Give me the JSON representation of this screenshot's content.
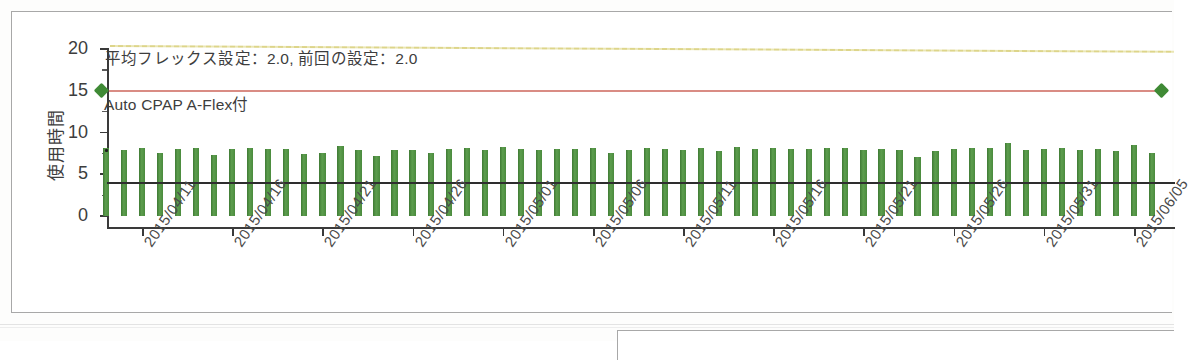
{
  "panel": {
    "name": "usage-chart-panel"
  },
  "chart_data": {
    "type": "bar",
    "title": "",
    "xlabel": "",
    "ylabel": "使用時間",
    "ylim": [
      0,
      21.5
    ],
    "yticks": [
      0,
      5,
      10,
      15,
      20
    ],
    "grid": false,
    "legend": "none",
    "x_start_date": "2015/04/09",
    "x_tick_labels": [
      "2015/04/11",
      "2015/04/16",
      "2015/04/21",
      "2015/04/26",
      "2015/05/01",
      "2015/05/06",
      "2015/05/11",
      "2015/05/16",
      "2015/05/21",
      "2015/05/26",
      "2015/05/31",
      "2015/06/05"
    ],
    "x_tick_indices": [
      2,
      7,
      12,
      17,
      22,
      27,
      32,
      37,
      42,
      47,
      52,
      57
    ],
    "series": [
      {
        "name": "使用時間",
        "type": "bar",
        "color": "#4c8c3f",
        "values": [
          8.1,
          7.9,
          8.1,
          7.6,
          8.0,
          8.1,
          7.3,
          8.0,
          8.1,
          8.0,
          8.0,
          7.4,
          7.5,
          8.4,
          7.9,
          7.2,
          7.9,
          7.9,
          7.6,
          8.0,
          8.1,
          7.9,
          8.3,
          8.0,
          7.9,
          8.0,
          8.0,
          8.1,
          7.5,
          7.9,
          8.2,
          8.0,
          7.9,
          8.1,
          7.8,
          8.3,
          8.0,
          8.2,
          8.0,
          8.0,
          8.2,
          8.1,
          7.9,
          8.0,
          7.9,
          7.1,
          7.8,
          8.0,
          8.1,
          8.2,
          8.7,
          7.9,
          8.0,
          8.1,
          7.9,
          8.0,
          7.8,
          8.5,
          7.6
        ]
      },
      {
        "name": "平均使用時間ライン",
        "type": "hline",
        "value": 4.0,
        "color": "#2e2e2e"
      },
      {
        "name": "Auto CPAP A-Flex付 圧ライン",
        "type": "hline",
        "value": 15.0,
        "color": "#d98c84",
        "marker": "diamond",
        "marker_color": "#3f8a35"
      },
      {
        "name": "フレックス設定ライン",
        "type": "hline",
        "value_start": 20.3,
        "value_end": 19.6,
        "color": "#ddd58a",
        "linestyle": "dotted"
      }
    ],
    "annotations": [
      {
        "text": "平均フレックス設定：2.0, 前回の設定：2.0",
        "y": 19.2
      },
      {
        "text": "Auto CPAP A-Flex付",
        "y": 13.6
      }
    ]
  }
}
